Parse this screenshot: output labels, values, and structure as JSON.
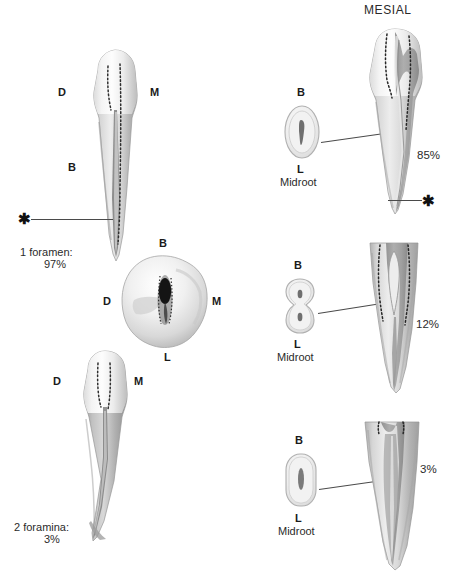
{
  "figure": {
    "headers": {
      "mesial": "MESIAL"
    },
    "colors": {
      "enamel_light": "#fbfbfb",
      "enamel_mid": "#e2e2e2",
      "dentin_shadow": "#9d9d9d",
      "root_gray": "#b9b9b9",
      "canal_dark": "#3a3a3a",
      "outline": "#8e8e8e",
      "text": "#1a1a1a",
      "leader": "#4a4a4a"
    }
  },
  "panels": {
    "left_top": {
      "name": "one-foramen-tooth",
      "orientation_labels": {
        "distal": "D",
        "mesial": "M",
        "buccal": "B"
      },
      "marker": "✱",
      "stat_line1": "1 foramen:",
      "stat_line2": "97%"
    },
    "left_middle": {
      "name": "occlusal-cross-section",
      "orientation_labels": {
        "buccal": "B",
        "distal": "D",
        "mesial": "M",
        "lingual": "L"
      }
    },
    "left_bottom": {
      "name": "two-foramina-tooth",
      "orientation_labels": {
        "distal": "D",
        "mesial": "M"
      },
      "stat_line1": "2 foramina:",
      "stat_line2": "3%"
    }
  },
  "mesial_rows": [
    {
      "id": "row-85",
      "percent": "85%",
      "canal_count": 1,
      "cross_section": {
        "shape": "oval",
        "buccal": "B",
        "lingual": "L",
        "caption": "Midroot",
        "canals": 1
      },
      "marker": "✱",
      "has_marker": true
    },
    {
      "id": "row-12",
      "percent": "12%",
      "canal_count": 2,
      "cross_section": {
        "shape": "hourglass",
        "buccal": "B",
        "lingual": "L",
        "caption": "Midroot",
        "canals": 2
      },
      "has_marker": false
    },
    {
      "id": "row-3",
      "percent": "3%",
      "canal_count": 1,
      "cross_section": {
        "shape": "rounded-rect",
        "buccal": "B",
        "lingual": "L",
        "caption": "Midroot",
        "canals": 1
      },
      "has_marker": false
    }
  ]
}
